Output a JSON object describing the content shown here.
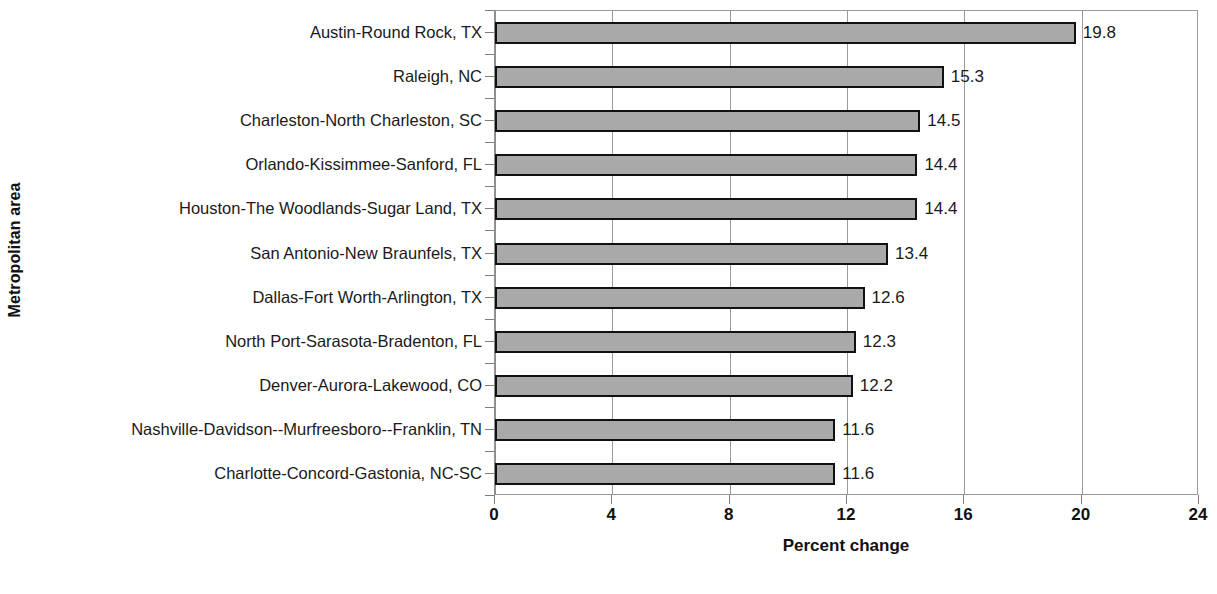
{
  "chart_data": {
    "type": "bar",
    "orientation": "horizontal",
    "title": "",
    "xlabel": "Percent change",
    "ylabel": "Metropolitan area",
    "xlim": [
      0,
      24
    ],
    "xticks": [
      0,
      4,
      8,
      12,
      16,
      20,
      24
    ],
    "xtick_labels": [
      "0",
      "4",
      "8",
      "12",
      "16",
      "20",
      "24"
    ],
    "grid": "vertical",
    "legend": "none",
    "categories": [
      "Austin-Round Rock, TX",
      "Raleigh, NC",
      "Charleston-North Charleston, SC",
      "Orlando-Kissimmee-Sanford, FL",
      "Houston-The Woodlands-Sugar Land, TX",
      "San Antonio-New Braunfels, TX",
      "Dallas-Fort Worth-Arlington, TX",
      "North Port-Sarasota-Bradenton, FL",
      "Denver-Aurora-Lakewood, CO",
      "Nashville-Davidson--Murfreesboro--Franklin, TN",
      "Charlotte-Concord-Gastonia, NC-SC"
    ],
    "values": [
      19.8,
      15.3,
      14.5,
      14.4,
      14.4,
      13.4,
      12.6,
      12.3,
      12.2,
      11.6,
      11.6
    ],
    "value_labels": [
      "19.8",
      "15.3",
      "14.5",
      "14.4",
      "14.4",
      "13.4",
      "12.6",
      "12.3",
      "12.2",
      "11.6",
      "11.6"
    ],
    "colors": {
      "bar_fill": "#a9a9a9",
      "bar_border": "#111111",
      "gridline": "#9a9a9a",
      "text": "#1a1a1a",
      "background": "#ffffff"
    }
  }
}
